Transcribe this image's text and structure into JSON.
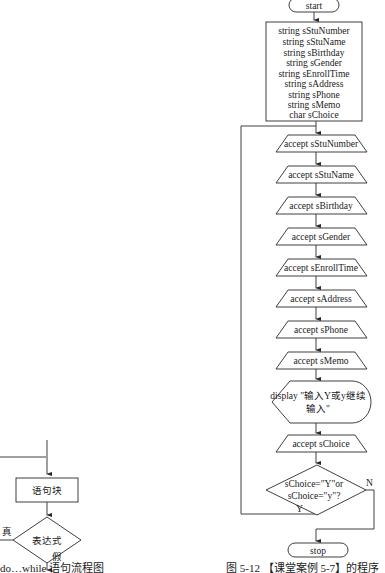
{
  "left_figure": {
    "block_label": "语句块",
    "condition_label": "表达式",
    "true_label": "真",
    "false_label": "假",
    "caption": "do…while 语句流程图"
  },
  "right_figure": {
    "start_label": "start",
    "declarations": [
      "string sStuNumber",
      "string sStuName",
      "string sBirthday",
      "string sGender",
      "string sEnrollTime",
      "string sAddress",
      "string sPhone",
      "string sMemo",
      "char sChoice"
    ],
    "inputs": [
      "accept sStuNumber",
      "accept sStuName",
      "accept sBirthday",
      "accept sGender",
      "accept sEnrollTime",
      "accept sAddress",
      "accept sPhone",
      "accept sMemo"
    ],
    "display_line1": "display \"输入Y或y继续",
    "display_line2": "输入\"",
    "choice_input": "accept sChoice",
    "decision_line1": "sChoice=\"Y\"or",
    "decision_line2": "sChoice=\"y\"?",
    "yes_label": "Y",
    "no_label": "N",
    "stop_label": "stop",
    "caption": "图 5-12 【课堂案例 5-7】的程序"
  }
}
